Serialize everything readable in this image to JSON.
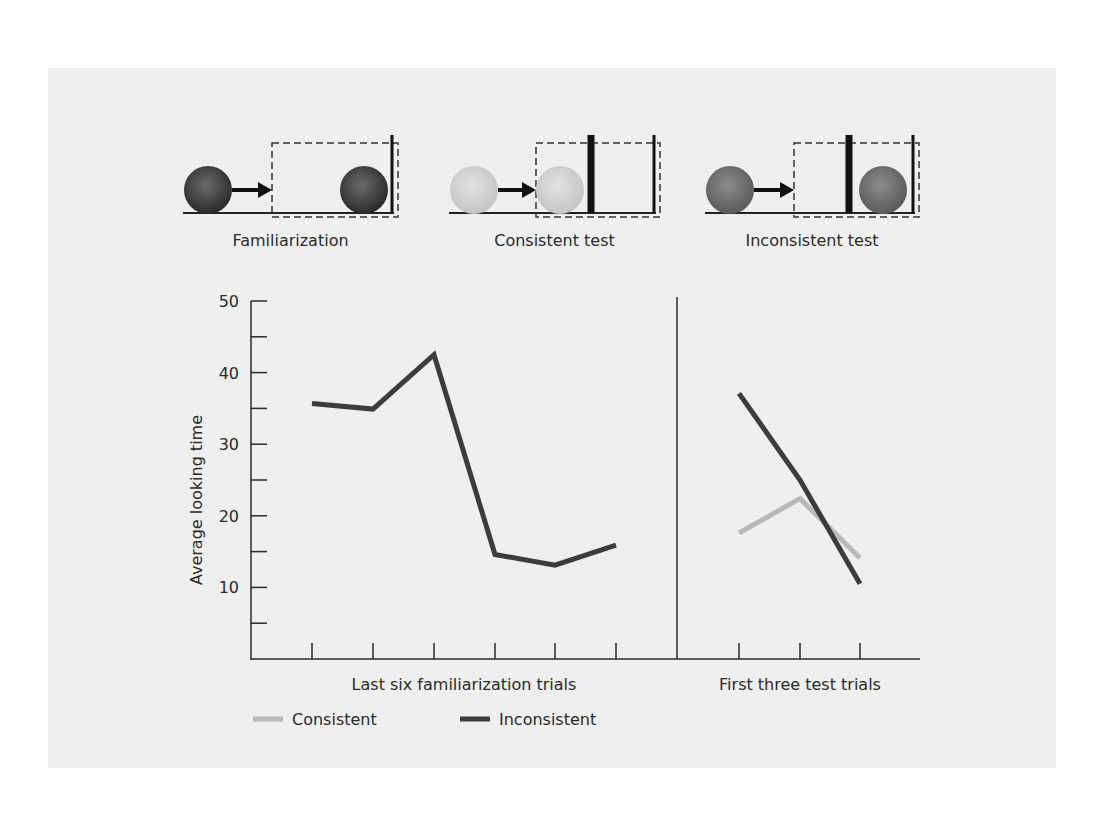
{
  "figure": {
    "background": "#efefef",
    "scenes": [
      {
        "label": "Familiarization",
        "ball_color": "dark",
        "ball_start_x": 208,
        "ball_end_x": 364,
        "box_x": 272,
        "walls": [
          {
            "x": 392,
            "width": 3
          }
        ]
      },
      {
        "label": "Consistent test",
        "ball_color": "light",
        "ball_start_x": 474,
        "ball_end_x": 560,
        "box_x": 536,
        "walls": [
          {
            "x": 591,
            "width": 7
          },
          {
            "x": 654,
            "width": 3
          }
        ]
      },
      {
        "label": "Inconsistent test",
        "ball_color": "medium",
        "ball_start_x": 730,
        "ball_end_x": 883,
        "box_x": 794,
        "walls": [
          {
            "x": 849,
            "width": 7
          },
          {
            "x": 913,
            "width": 3
          }
        ]
      }
    ]
  },
  "chart_data": {
    "type": "line",
    "title": "",
    "ylabel": "Average looking time",
    "ylim": [
      0,
      50
    ],
    "yticks_major": [
      10,
      20,
      30,
      40,
      50
    ],
    "yticks_minor": [
      5,
      15,
      25,
      35,
      45
    ],
    "grid": false,
    "panels": [
      {
        "xlabel": "Last six familiarization trials",
        "x": [
          1,
          2,
          3,
          4,
          5,
          6
        ],
        "series": [
          {
            "name": "Inconsistent",
            "values": [
              35.7,
              34.9,
              42.5,
              14.6,
              13.1,
              15.9
            ]
          }
        ]
      },
      {
        "xlabel": "First three test trials",
        "x": [
          1,
          2,
          3
        ],
        "series": [
          {
            "name": "Consistent",
            "values": [
              17.6,
              22.4,
              14.1
            ]
          },
          {
            "name": "Inconsistent",
            "values": [
              37.1,
              25.0,
              10.5
            ]
          }
        ]
      }
    ],
    "legend": [
      {
        "name": "Consistent",
        "color": "#b9b9b9"
      },
      {
        "name": "Inconsistent",
        "color": "#3c3c3c"
      }
    ],
    "legend_position": "bottom-left"
  }
}
